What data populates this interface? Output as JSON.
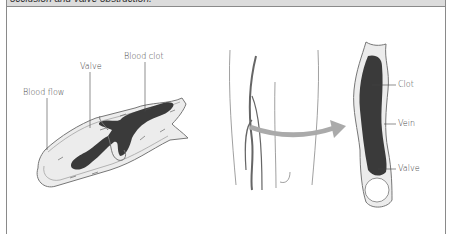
{
  "caption": {
    "text": "occlusion and valve obstruction."
  },
  "left_diagram": {
    "title": "Vein segment with blood clot",
    "labels": {
      "blood_flow": "Blood flow",
      "valve": "Valve",
      "blood_clot": "Blood clot"
    }
  },
  "middle_diagram": {
    "title": "Leg with veins"
  },
  "right_diagram": {
    "title": "Vein occluded by clot",
    "labels": {
      "clot": "Clot",
      "vein": "Vein",
      "valve": "Valve"
    }
  },
  "colors": {
    "clot": "#3a3a3a",
    "vessel_fill": "#ececec",
    "vessel_stroke": "#777777",
    "arrow": "#aaaaaa",
    "header_band": "#dcdcdc",
    "frame": "#8a8a8a"
  }
}
